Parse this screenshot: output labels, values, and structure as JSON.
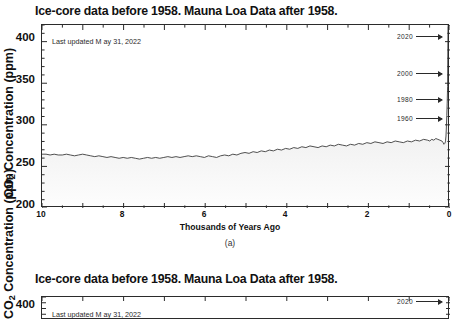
{
  "figure": {
    "panels": [
      {
        "id": "a",
        "caption": "(a)",
        "title": "Ice-core data before 1958. Mauna Loa Data after 1958.",
        "note": "Last updated M ay 31, 2022",
        "annotations": [
          {
            "label": "2020",
            "ppm": 415
          },
          {
            "label": "2000",
            "ppm": 370
          },
          {
            "label": "1980",
            "ppm": 339
          },
          {
            "label": "1960",
            "ppm": 317
          }
        ]
      },
      {
        "id": "b",
        "title": "Ice-core data before 1958. Mauna Loa Data after 1958.",
        "note": "Last updated M ay 31, 2022",
        "annotations": [
          {
            "label": "2020",
            "ppm": 415
          }
        ]
      }
    ]
  },
  "chart_data": {
    "type": "area",
    "title": "Ice-core data before 1958. Mauna Loa Data after 1958.",
    "subtitle": "",
    "xlabel": "Thousands of Years Ago",
    "ylabel": "CO2 Concentration (ppm)",
    "ylabel_rich": {
      "pre": "CO",
      "sub": "2",
      "post": " Concentration (ppm)"
    },
    "xlim": [
      10,
      0
    ],
    "ylim": [
      200,
      420
    ],
    "x_reversed": true,
    "xticks": [
      10,
      8,
      6,
      4,
      2,
      0
    ],
    "xticklabels": [
      "10",
      "8",
      "6",
      "4",
      "2",
      "0"
    ],
    "yticks": [
      200,
      250,
      300,
      350,
      400
    ],
    "yticklabels": [
      "200",
      "250",
      "300",
      "350",
      "400"
    ],
    "xminor_step": 0.5,
    "yminor_step": 10,
    "grid": false,
    "legend": false,
    "line_color": "#3a3a3a",
    "fill_top_color": "#d8d8d8",
    "fill_bottom_color": "#fbfbfb",
    "series": [
      {
        "name": "CO2 concentration",
        "x": [
          10.0,
          9.9,
          9.8,
          9.7,
          9.6,
          9.5,
          9.4,
          9.3,
          9.2,
          9.1,
          9.0,
          8.9,
          8.8,
          8.7,
          8.6,
          8.5,
          8.4,
          8.3,
          8.2,
          8.1,
          8.0,
          7.9,
          7.8,
          7.7,
          7.6,
          7.5,
          7.4,
          7.3,
          7.2,
          7.1,
          7.0,
          6.9,
          6.8,
          6.7,
          6.6,
          6.5,
          6.4,
          6.3,
          6.2,
          6.1,
          6.0,
          5.9,
          5.8,
          5.7,
          5.6,
          5.5,
          5.4,
          5.3,
          5.2,
          5.1,
          5.0,
          4.9,
          4.8,
          4.7,
          4.6,
          4.5,
          4.4,
          4.3,
          4.2,
          4.1,
          4.0,
          3.9,
          3.8,
          3.7,
          3.6,
          3.5,
          3.4,
          3.3,
          3.2,
          3.1,
          3.0,
          2.9,
          2.8,
          2.7,
          2.6,
          2.5,
          2.4,
          2.3,
          2.2,
          2.1,
          2.0,
          1.9,
          1.8,
          1.7,
          1.6,
          1.5,
          1.4,
          1.3,
          1.2,
          1.1,
          1.0,
          0.9,
          0.8,
          0.7,
          0.6,
          0.5,
          0.45,
          0.4,
          0.35,
          0.3,
          0.25,
          0.2,
          0.15,
          0.12,
          0.1,
          0.08,
          0.064,
          0.06,
          0.05,
          0.04,
          0.03,
          0.02,
          0.01,
          0.0
        ],
        "y": [
          263,
          263,
          262,
          263,
          262,
          262,
          263,
          262,
          261,
          262,
          263,
          262,
          261,
          260,
          261,
          260,
          259,
          260,
          259,
          258,
          259,
          258,
          259,
          258,
          257,
          258,
          259,
          258,
          259,
          258,
          259,
          260,
          259,
          260,
          259,
          260,
          261,
          260,
          261,
          260,
          259,
          261,
          260,
          259,
          261,
          262,
          261,
          263,
          262,
          264,
          265,
          264,
          266,
          265,
          267,
          266,
          268,
          267,
          269,
          268,
          270,
          269,
          271,
          270,
          272,
          271,
          273,
          272,
          271,
          273,
          272,
          274,
          273,
          275,
          274,
          273,
          275,
          274,
          276,
          275,
          277,
          276,
          278,
          277,
          276,
          278,
          277,
          279,
          278,
          277,
          279,
          278,
          280,
          279,
          281,
          280,
          279,
          281,
          280,
          282,
          281,
          280,
          279,
          277,
          275,
          276,
          278,
          280,
          285,
          296,
          310,
          325,
          345,
          418
        ],
        "values_note": "ppm"
      }
    ],
    "annotations": [
      {
        "label": "2020",
        "ppm": 415,
        "arrow": "right"
      },
      {
        "label": "2000",
        "ppm": 370,
        "arrow": "right"
      },
      {
        "label": "1980",
        "ppm": 339,
        "arrow": "right"
      },
      {
        "label": "1960",
        "ppm": 317,
        "arrow": "right"
      }
    ],
    "text_annotations": [
      {
        "text": "Last updated M ay 31, 2022",
        "x": 9.4,
        "y": 398
      }
    ]
  }
}
